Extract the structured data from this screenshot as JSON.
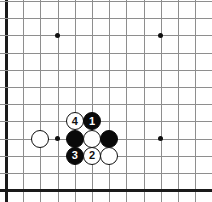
{
  "diagram": {
    "kind": "go-board-diagram",
    "board": {
      "visible_columns": 12,
      "visible_rows": 12,
      "cell_size": 17.2,
      "origin_x": 6,
      "origin_y": 1,
      "line_color": "#8e8e8e",
      "edge_color": "#1a1a1a",
      "background_color": "#ffffff",
      "edges": [
        "left",
        "bottom"
      ]
    },
    "star_points": [
      {
        "name": "star-point-upper-left",
        "col": 3,
        "row": 2
      },
      {
        "name": "star-point-upper-right",
        "col": 9,
        "row": 2
      },
      {
        "name": "star-point-lower-left",
        "col": 3,
        "row": 8
      },
      {
        "name": "star-point-lower-right",
        "col": 9,
        "row": 8
      }
    ],
    "stones": [
      {
        "name": "stone-white-left",
        "color": "white",
        "label": "",
        "col": 2,
        "row": 8
      },
      {
        "name": "stone-white-move-4",
        "color": "white",
        "label": "4",
        "col": 4,
        "row": 7
      },
      {
        "name": "stone-black-move-1",
        "color": "black",
        "label": "1",
        "col": 5,
        "row": 7
      },
      {
        "name": "stone-black-center-left",
        "color": "black",
        "label": "",
        "col": 4,
        "row": 8
      },
      {
        "name": "stone-white-center",
        "color": "white",
        "label": "",
        "col": 5,
        "row": 8
      },
      {
        "name": "stone-black-center-right",
        "color": "black",
        "label": "",
        "col": 6,
        "row": 8
      },
      {
        "name": "stone-black-move-3",
        "color": "black",
        "label": "3",
        "col": 4,
        "row": 9
      },
      {
        "name": "stone-white-move-2",
        "color": "white",
        "label": "2",
        "col": 5,
        "row": 9
      },
      {
        "name": "stone-white-lower-right",
        "color": "white",
        "label": "",
        "col": 6,
        "row": 9
      }
    ],
    "colors": {
      "black_stone": "#0a0a0a",
      "white_stone": "#ffffff",
      "stone_outline": "#101010",
      "black_label": "#ffffff",
      "white_label": "#101010"
    }
  }
}
